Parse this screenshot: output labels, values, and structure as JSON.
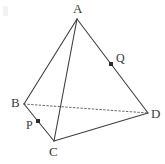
{
  "figure": {
    "kind": "geometry-diagram",
    "shape": "tetrahedron",
    "canvas": {
      "width": 165,
      "height": 164,
      "background": "#ffffff"
    },
    "stroke": {
      "color": "#3f3f3f",
      "width": 1.1,
      "hidden_color": "#555555"
    },
    "vertices": [
      {
        "id": "A",
        "label": "A",
        "x": 77,
        "y": 19,
        "label_x": 73,
        "label_y": 2
      },
      {
        "id": "B",
        "label": "B",
        "x": 24,
        "y": 104,
        "label_x": 11,
        "label_y": 96
      },
      {
        "id": "C",
        "label": "C",
        "x": 54,
        "y": 141,
        "label_x": 49,
        "label_y": 145
      },
      {
        "id": "D",
        "label": "D",
        "x": 148,
        "y": 113,
        "label_x": 151,
        "label_y": 107
      }
    ],
    "edges": [
      {
        "id": "AB",
        "from": "A",
        "to": "B",
        "style": "solid"
      },
      {
        "id": "AC",
        "from": "A",
        "to": "C",
        "style": "solid"
      },
      {
        "id": "AD",
        "from": "A",
        "to": "D",
        "style": "solid"
      },
      {
        "id": "BC",
        "from": "B",
        "to": "C",
        "style": "solid"
      },
      {
        "id": "CD",
        "from": "C",
        "to": "D",
        "style": "solid"
      },
      {
        "id": "BD",
        "from": "B",
        "to": "D",
        "style": "dotted"
      }
    ],
    "points": [
      {
        "id": "P",
        "label": "P",
        "on_edge": "BC",
        "x": 38,
        "y": 121,
        "label_x": 26,
        "label_y": 119
      },
      {
        "id": "Q",
        "label": "Q",
        "on_edge": "AD",
        "x": 111,
        "y": 64,
        "label_x": 116,
        "label_y": 52
      }
    ]
  }
}
